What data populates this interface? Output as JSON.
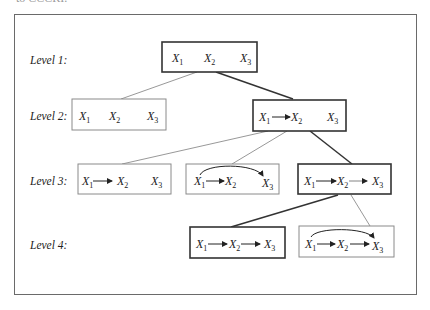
{
  "caption_fragment": "to CCCRI.",
  "levels": [
    {
      "label": "Level 1:"
    },
    {
      "label": "Level 2:"
    },
    {
      "label": "Level 3:"
    },
    {
      "label": "Level 4:"
    }
  ],
  "variables": {
    "letter": "X",
    "subs": [
      "1",
      "2",
      "3"
    ]
  },
  "nodes": [
    {
      "id": "L1",
      "level": 1,
      "structure": "X1  X2  X3",
      "edges": [],
      "emphasized": true
    },
    {
      "id": "L2a",
      "level": 2,
      "structure": "X1  X2  X3",
      "edges": [],
      "emphasized": false
    },
    {
      "id": "L2b",
      "level": 2,
      "structure": "X1 -> X2  X3",
      "edges": [
        "X1->X2"
      ],
      "emphasized": true
    },
    {
      "id": "L3a",
      "level": 3,
      "structure": "X1 -> X2  X3",
      "edges": [
        "X1->X2"
      ],
      "emphasized": false
    },
    {
      "id": "L3b",
      "level": 3,
      "structure": "X1 -> X2, X1 -> X3 (curved)",
      "edges": [
        "X1->X2",
        "X1->X3"
      ],
      "emphasized": false
    },
    {
      "id": "L3c",
      "level": 3,
      "structure": "X1 -> X2 -> X3",
      "edges": [
        "X1->X2",
        "X2->X3"
      ],
      "emphasized": true
    },
    {
      "id": "L4a",
      "level": 4,
      "structure": "X1 -> X2 -> X3",
      "edges": [
        "X1->X2",
        "X2->X3"
      ],
      "emphasized": true
    },
    {
      "id": "L4b",
      "level": 4,
      "structure": "X1 -> X2 -> X3, X1 -> X3 (curved)",
      "edges": [
        "X1->X2",
        "X2->X3",
        "X1->X3"
      ],
      "emphasized": false
    }
  ],
  "tree_edges": [
    {
      "from": "L1",
      "to": "L2a",
      "emphasized": false
    },
    {
      "from": "L1",
      "to": "L2b",
      "emphasized": true
    },
    {
      "from": "L2b",
      "to": "L3a",
      "emphasized": false
    },
    {
      "from": "L2b",
      "to": "L3b",
      "emphasized": false
    },
    {
      "from": "L2b",
      "to": "L3c",
      "emphasized": true
    },
    {
      "from": "L3c",
      "to": "L4a",
      "emphasized": true
    },
    {
      "from": "L3c",
      "to": "L4b",
      "emphasized": false
    }
  ]
}
